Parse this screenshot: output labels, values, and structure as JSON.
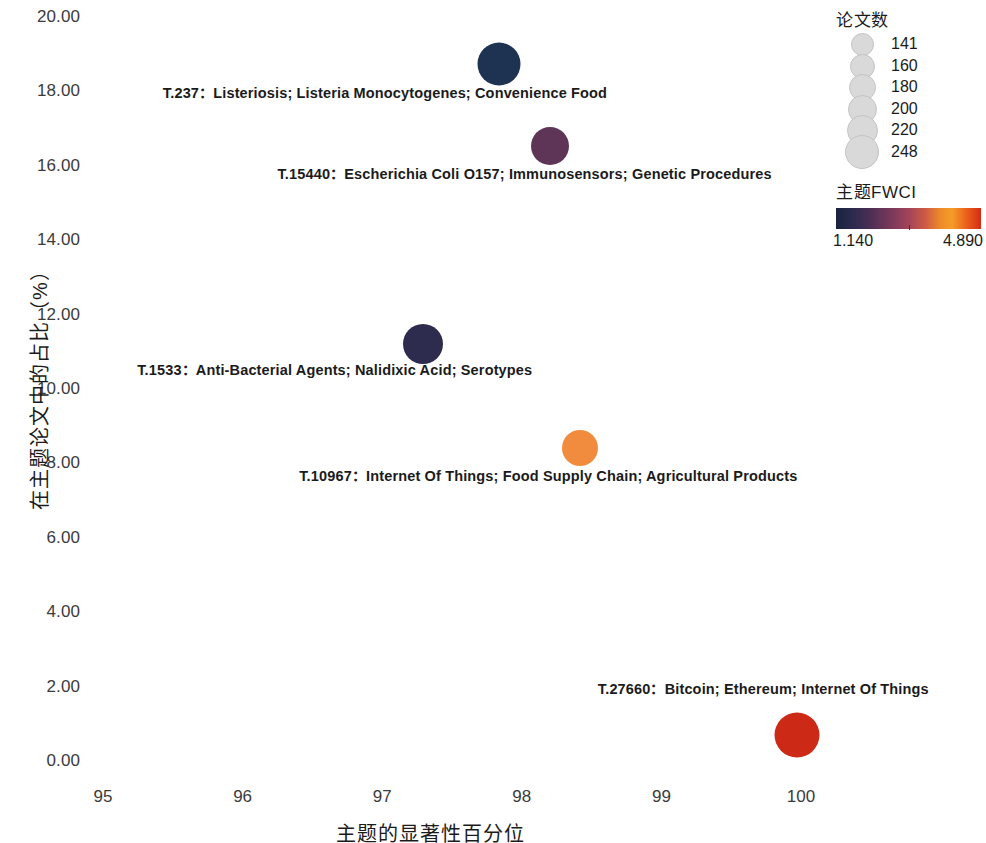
{
  "chart_data": {
    "type": "scatter",
    "title": "",
    "xlabel": "主题的显著性百分位",
    "ylabel": "在主题论文中的占比（%）",
    "xlim": [
      94.6,
      100.6
    ],
    "ylim": [
      -0.5,
      20.5
    ],
    "x_ticks": [
      "95",
      "96",
      "97",
      "98",
      "99",
      "100"
    ],
    "x_tick_values": [
      95,
      96,
      97,
      98,
      99,
      100
    ],
    "y_ticks": [
      "0.00",
      "2.00",
      "4.00",
      "6.00",
      "8.00",
      "10.00",
      "12.00",
      "14.00",
      "16.00",
      "18.00",
      "20.00"
    ],
    "y_tick_values": [
      0,
      2,
      4,
      6,
      8,
      10,
      12,
      14,
      16,
      18,
      20
    ],
    "grid": false,
    "legend_position": "right",
    "points": [
      {
        "label": "T.237：Listeriosis; Listeria Monocytogenes; Convenience Food",
        "x": 97.84,
        "y": 18.76,
        "size_value": 248,
        "diameter_px": 43,
        "color": "#1e3352",
        "label_x": 97.02,
        "label_y": 18.05
      },
      {
        "label": "T.15440：Escherichia Coli O157; Immunosensors; Genetic Procedures",
        "x": 98.2,
        "y": 16.55,
        "size_value": 200,
        "diameter_px": 38,
        "color": "#5e3556",
        "label_x": 98.02,
        "label_y": 15.87
      },
      {
        "label": "T.1533：Anti-Bacterial Agents; Nalidixic Acid; Serotypes",
        "x": 97.29,
        "y": 11.24,
        "size_value": 220,
        "diameter_px": 40,
        "color": "#2e2c4e",
        "label_x": 96.66,
        "label_y": 10.6
      },
      {
        "label": "T.10967：Internet Of Things; Food Supply Chain; Agricultural Products",
        "x": 98.42,
        "y": 8.44,
        "size_value": 180,
        "diameter_px": 36,
        "color": "#f18c3e",
        "label_x": 98.19,
        "label_y": 7.75
      },
      {
        "label": "T.27660：Bitcoin; Ethereum; Internet Of Things",
        "x": 99.97,
        "y": 0.73,
        "size_value": 248,
        "diameter_px": 45,
        "color": "#cc2a17",
        "label_x": 99.73,
        "label_y": 2.01
      }
    ],
    "size_legend": {
      "title": "论文数",
      "entries": [
        {
          "value": "141",
          "diameter_px": 23
        },
        {
          "value": "160",
          "diameter_px": 25
        },
        {
          "value": "180",
          "diameter_px": 27
        },
        {
          "value": "200",
          "diameter_px": 29
        },
        {
          "value": "220",
          "diameter_px": 31
        },
        {
          "value": "248",
          "diameter_px": 34
        }
      ]
    },
    "color_legend": {
      "title": "主题FWCI",
      "min": "1.140",
      "max": "4.890",
      "min_value": 1.14,
      "max_value": 4.89,
      "colormap": "magma-like"
    }
  }
}
